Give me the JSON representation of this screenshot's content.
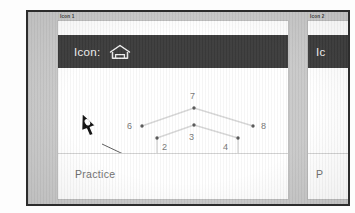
{
  "app": {
    "panels": [
      {
        "tab_label": "Icon 1",
        "header_title": "Icon:",
        "header_icon": "house-icon",
        "footer_label": "Practice"
      },
      {
        "tab_label": "Icon 2",
        "header_title": "Ic",
        "footer_label": "P"
      }
    ]
  },
  "canvas": {
    "cursor": "pen-nib-cursor",
    "points": [
      {
        "id": "1",
        "label": "1",
        "x": 99,
        "y": 102,
        "label_x": 86,
        "label_y": 104
      },
      {
        "id": "2",
        "label": "2",
        "x": 99,
        "y": 70,
        "label_x": 104,
        "label_y": 82
      },
      {
        "id": "3",
        "label": "3",
        "x": 136,
        "y": 57,
        "label_x": 131,
        "label_y": 72
      },
      {
        "id": "4",
        "label": "4",
        "x": 180,
        "y": 70,
        "label_x": 165,
        "label_y": 82
      },
      {
        "id": "5",
        "label": "5",
        "x": 180,
        "y": 102,
        "label_x": 189,
        "label_y": 105
      },
      {
        "id": "6",
        "label": "6",
        "x": 84,
        "y": 58,
        "label_x": 69,
        "label_y": 61
      },
      {
        "id": "7",
        "label": "7",
        "x": 136,
        "y": 40,
        "label_x": 132,
        "label_y": 31
      },
      {
        "id": "8",
        "label": "8",
        "x": 195,
        "y": 58,
        "label_x": 203,
        "label_y": 61
      }
    ],
    "edges": [
      {
        "from": "6",
        "to": "7"
      },
      {
        "from": "7",
        "to": "8"
      },
      {
        "from": "2",
        "to": "3"
      },
      {
        "from": "3",
        "to": "4"
      },
      {
        "from": "1",
        "to": "2"
      },
      {
        "from": "4",
        "to": "5"
      },
      {
        "from": "1",
        "to": "5"
      }
    ],
    "lead_line": {
      "x1": 44,
      "y1": 76,
      "x2": 99,
      "y2": 102
    }
  },
  "colors": {
    "header_bg": "#3b3b3b",
    "header_text": "#f2f2f2",
    "canvas_bg": "#ffffff",
    "frame_bg": "#c9c9c9",
    "dot": "#5a5a5a",
    "edge": "#d7d7d7",
    "label": "#787878",
    "footer_text": "#6f6f6f"
  }
}
